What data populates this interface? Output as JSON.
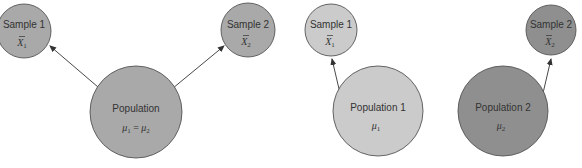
{
  "colors": {
    "background": "#ffffff",
    "medium_gray": "#a9a9a9",
    "light_gray": "#cbcbcb",
    "dark_gray": "#8f8f8f",
    "stroke": "#555555",
    "text": "#333333"
  },
  "left_diagram": {
    "population": {
      "label": "Population",
      "formula_lhs": "μ",
      "sub1": "1",
      "eq": " = ",
      "formula_rhs": "μ",
      "sub2": "2"
    },
    "sample1": {
      "label": "Sample 1",
      "symbol": "X",
      "bar": "‾",
      "sub": "1"
    },
    "sample2": {
      "label": "Sample 2",
      "symbol": "X",
      "bar": "‾",
      "sub": "2"
    }
  },
  "right_diagram": {
    "population1": {
      "label": "Population 1",
      "symbol": "μ",
      "sub": "1"
    },
    "population2": {
      "label": "Population 2",
      "symbol": "μ",
      "sub": "2"
    },
    "sample1": {
      "label": "Sample 1",
      "symbol": "X",
      "bar": "‾",
      "sub": "1"
    },
    "sample2": {
      "label": "Sample 2",
      "symbol": "X",
      "bar": "‾",
      "sub": "2"
    }
  }
}
